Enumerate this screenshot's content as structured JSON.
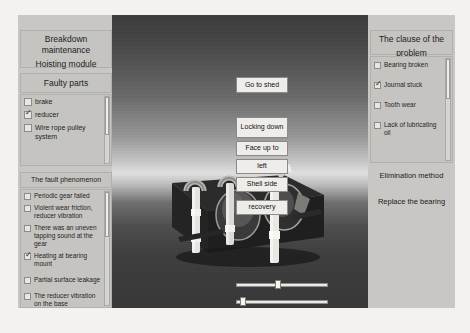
{
  "window": {
    "title": "Breakdown maintenance Hoisting module"
  },
  "left_panel": {
    "header_line1": "Breakdown maintenance",
    "header_line2": "Hoisting module",
    "faulty_parts_title": "Faulty parts",
    "faulty_parts": [
      {
        "label": "brake",
        "checked": false
      },
      {
        "label": "reducer",
        "checked": true
      },
      {
        "label": "Wire rope pulley system",
        "checked": false
      }
    ],
    "fault_phenomenon_title": "The fault phenomenon",
    "fault_phenomenon": [
      {
        "label": "Periodic gear failed",
        "checked": false
      },
      {
        "label": "Violent wear friction, reducer vibration",
        "checked": false
      },
      {
        "label": "There was an uneven tapping sound at the gear",
        "checked": false
      },
      {
        "label": "Heating at bearing mount",
        "checked": true
      },
      {
        "label": "Partial surface leakage",
        "checked": false
      },
      {
        "label": "The reducer vibration on the base",
        "checked": false
      },
      {
        "label": "Reducer overall heating",
        "checked": false
      }
    ]
  },
  "right_panel": {
    "cause_title_line1": "The clause of the",
    "cause_title_line2": "problem",
    "causes": [
      {
        "label": "Bearing broken",
        "checked": false
      },
      {
        "label": "Journal stuck",
        "checked": true
      },
      {
        "label": "Tooth wear",
        "checked": false
      },
      {
        "label": "Lack of lubricating oil",
        "checked": false
      }
    ],
    "elimination_title": "Elimination method",
    "elimination_body": "Replace the bearing"
  },
  "viewport": {
    "buttons": {
      "go_to_shed": "Go to shed",
      "locking_down": "Locking down",
      "face_up_to": "Face up to",
      "left": "left",
      "shell_side": "Shell side",
      "recovery": "recovery",
      "return": "return"
    },
    "sliders": [
      {
        "name": "slider-1",
        "value_pct": 42
      },
      {
        "name": "slider-2",
        "value_pct": 4
      }
    ],
    "scene_description": "3D reducer gear shaft assembly on base plate"
  },
  "colors": {
    "panel_bg": "#c6c4c1",
    "button_bg": "#efedea",
    "viewport_top": "#3a3a3a",
    "viewport_horizon": "#e2e2e2",
    "viewport_ground": "#3d3d3d",
    "text": "#1d1d1d"
  }
}
